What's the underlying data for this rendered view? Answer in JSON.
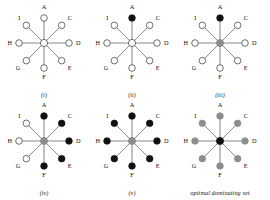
{
  "figure": {
    "title": "",
    "node_names": [
      "A",
      "C",
      "D",
      "E",
      "F",
      "G",
      "H",
      "I"
    ],
    "center_name": "B",
    "colors": {
      "white": "#ffffff",
      "black": "#111111",
      "gray": "#8c8c8c",
      "edge": "#555555",
      "outline": "#333333",
      "text": "#141414"
    },
    "panels": [
      {
        "caption": "(i)",
        "center_state": "white",
        "nodes": [
          {
            "label": "A",
            "state": "white"
          },
          {
            "label": "C",
            "state": "white"
          },
          {
            "label": "D",
            "state": "white"
          },
          {
            "label": "E",
            "state": "white"
          },
          {
            "label": "F",
            "state": "white"
          },
          {
            "label": "G",
            "state": "white"
          },
          {
            "label": "H",
            "state": "white"
          },
          {
            "label": "I",
            "state": "white"
          }
        ]
      },
      {
        "caption": "(ii)",
        "center_state": "white",
        "nodes": [
          {
            "label": "A",
            "state": "black"
          },
          {
            "label": "C",
            "state": "white"
          },
          {
            "label": "D",
            "state": "white"
          },
          {
            "label": "E",
            "state": "white"
          },
          {
            "label": "F",
            "state": "white"
          },
          {
            "label": "G",
            "state": "white"
          },
          {
            "label": "H",
            "state": "white"
          },
          {
            "label": "I",
            "state": "white"
          }
        ]
      },
      {
        "caption": "(iii)",
        "center_state": "gray",
        "nodes": [
          {
            "label": "A",
            "state": "black"
          },
          {
            "label": "C",
            "state": "white"
          },
          {
            "label": "D",
            "state": "white"
          },
          {
            "label": "E",
            "state": "white"
          },
          {
            "label": "F",
            "state": "white"
          },
          {
            "label": "G",
            "state": "white"
          },
          {
            "label": "H",
            "state": "white"
          },
          {
            "label": "I",
            "state": "white"
          }
        ]
      },
      {
        "caption": "(iv)",
        "center_state": "gray",
        "nodes": [
          {
            "label": "A",
            "state": "black"
          },
          {
            "label": "C",
            "state": "black"
          },
          {
            "label": "D",
            "state": "black"
          },
          {
            "label": "E",
            "state": "black"
          },
          {
            "label": "F",
            "state": "black"
          },
          {
            "label": "G",
            "state": "white"
          },
          {
            "label": "H",
            "state": "white"
          },
          {
            "label": "I",
            "state": "white"
          }
        ]
      },
      {
        "caption": "(v)",
        "center_state": "gray",
        "nodes": [
          {
            "label": "A",
            "state": "black"
          },
          {
            "label": "C",
            "state": "black"
          },
          {
            "label": "D",
            "state": "black"
          },
          {
            "label": "E",
            "state": "black"
          },
          {
            "label": "F",
            "state": "black"
          },
          {
            "label": "G",
            "state": "black"
          },
          {
            "label": "H",
            "state": "black"
          },
          {
            "label": "I",
            "state": "black"
          }
        ]
      },
      {
        "caption": "optimal dominating set",
        "center_state": "black",
        "nodes": [
          {
            "label": "A",
            "state": "gray"
          },
          {
            "label": "C",
            "state": "gray"
          },
          {
            "label": "D",
            "state": "gray"
          },
          {
            "label": "E",
            "state": "gray"
          },
          {
            "label": "F",
            "state": "gray"
          },
          {
            "label": "G",
            "state": "gray"
          },
          {
            "label": "H",
            "state": "gray"
          },
          {
            "label": "I",
            "state": "gray"
          }
        ]
      }
    ]
  }
}
